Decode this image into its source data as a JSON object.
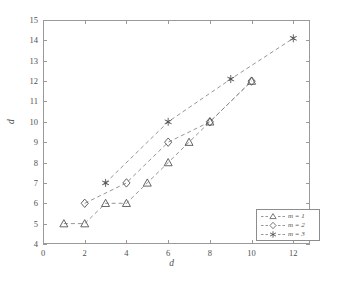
{
  "chart_data": {
    "type": "scatter",
    "title": "",
    "xlabel": "d",
    "ylabel": "d",
    "xlim": [
      0,
      12.8
    ],
    "ylim": [
      4,
      15
    ],
    "xticks": [
      0,
      2,
      4,
      6,
      8,
      10,
      12
    ],
    "yticks": [
      4,
      5,
      6,
      7,
      8,
      9,
      10,
      11,
      12,
      13,
      14,
      15
    ],
    "grid": false,
    "legend_position": "lower right",
    "linestyle": "dashed",
    "series": [
      {
        "name": "m = 1",
        "marker": "triangle",
        "x": [
          1,
          2,
          3,
          4,
          5,
          6,
          7,
          8,
          10
        ],
        "y": [
          5,
          5,
          6,
          6,
          7,
          8,
          9,
          10,
          12
        ]
      },
      {
        "name": "m = 2",
        "marker": "diamond",
        "x": [
          2,
          4,
          6,
          8,
          10
        ],
        "y": [
          6,
          7,
          9,
          10,
          12
        ]
      },
      {
        "name": "m = 3",
        "marker": "star",
        "x": [
          3,
          6,
          9,
          12
        ],
        "y": [
          7,
          10,
          12.1,
          14.1
        ]
      }
    ],
    "colors": {
      "axis": "#9a9a9a",
      "line": "#8a8a8a",
      "marker": "#555555",
      "text": "#4f4f4f",
      "background": "#ffffff"
    }
  }
}
